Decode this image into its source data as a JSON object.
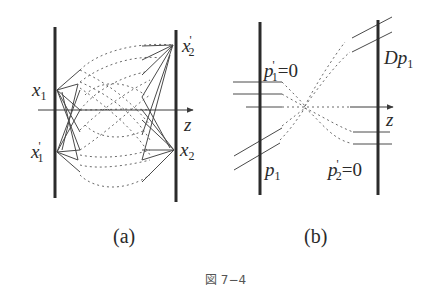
{
  "figure": {
    "caption": "図 7−4",
    "panels": [
      {
        "id": "a",
        "label": "(a)",
        "points": {
          "x1": {
            "base": "x",
            "sub": "1",
            "prime": ""
          },
          "x1_prime": {
            "base": "x",
            "sub": "1",
            "prime": "'"
          },
          "x2": {
            "base": "x",
            "sub": "2",
            "prime": ""
          },
          "x2_prime": {
            "base": "x",
            "sub": "2",
            "prime": "'"
          }
        },
        "axis_label": "z"
      },
      {
        "id": "b",
        "label": "(b)",
        "annotations": {
          "p1_prime_eq0": {
            "base": "p",
            "sub": "1",
            "prime": "'",
            "rhs": "=0"
          },
          "p1": {
            "base": "p",
            "sub": "1"
          },
          "Dp1": {
            "prefix": "D",
            "base": "p",
            "sub": "1"
          },
          "p2_prime_eq0": {
            "base": "p",
            "sub": "2",
            "prime": "'",
            "rhs": "=0"
          }
        },
        "axis_label": "z"
      }
    ]
  },
  "colors": {
    "bars": "#2b2b2b",
    "rays": "#4a4a4a",
    "dashed": "#6a6a6a",
    "text": "#2a2a2a",
    "caption": "#555555"
  }
}
